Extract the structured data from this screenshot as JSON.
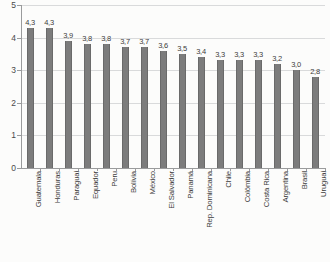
{
  "chart_data": {
    "type": "bar",
    "title": "",
    "subtitle": "",
    "xlabel": "",
    "ylabel": "",
    "ylim": [
      0,
      5
    ],
    "ytick_labels": [
      "0",
      "1",
      "2",
      "3",
      "4",
      "5"
    ],
    "ytick_values": [
      0,
      1,
      2,
      3,
      4,
      5
    ],
    "grid": true,
    "legend": false,
    "legend_position": "none",
    "decimal_separator": ",",
    "bar_color": "#7c7c7c",
    "gridline_color": "#d9dadb",
    "axis_color": "#9a9b9c",
    "background_color": "#fcfcfb",
    "categories": [
      "Guatemala",
      "Honduras",
      "Paraguai",
      "Equador",
      "Peru",
      "Bolívia",
      "México",
      "El Salvador",
      "Panamá",
      "Rep. Dominicana",
      "Chile",
      "Colômbia",
      "Costa Rica",
      "Argentina",
      "Brasil",
      "Uruguai"
    ],
    "values": [
      4.3,
      4.3,
      3.9,
      3.8,
      3.8,
      3.7,
      3.7,
      3.6,
      3.5,
      3.4,
      3.3,
      3.3,
      3.3,
      3.2,
      3.0,
      2.8
    ],
    "value_labels": [
      "4,3",
      "4,3",
      "3,9",
      "3,8",
      "3,8",
      "3,7",
      "3,7",
      "3,6",
      "3,5",
      "3,4",
      "3,3",
      "3,3",
      "3,3",
      "3,2",
      "3,0",
      "2,8"
    ]
  }
}
